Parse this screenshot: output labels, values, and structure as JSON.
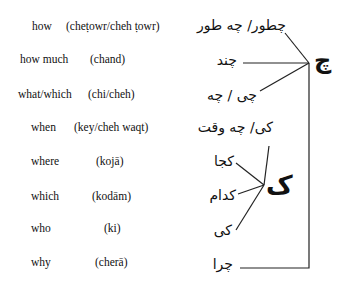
{
  "rows": [
    {
      "english": "how",
      "translit": "(cheṭowr/cheh ṭowr)",
      "persian": "چطور/ چه طور"
    },
    {
      "english": "how much",
      "translit": "(chand)",
      "persian": "چند"
    },
    {
      "english": "what/which",
      "translit": "(chi/cheh)",
      "persian": "چی / چه"
    },
    {
      "english": "when",
      "translit": "(key/cheh waqt)",
      "persian": "کی/ چه وقت"
    },
    {
      "english": "where",
      "translit": "(kojā)",
      "persian": "کجا"
    },
    {
      "english": "which",
      "translit": "(kodām)",
      "persian": "کدام"
    },
    {
      "english": "who",
      "translit": "(ki)",
      "persian": "کی"
    },
    {
      "english": "why",
      "translit": "(cherā)",
      "persian": "چرا"
    }
  ],
  "hubs": {
    "che": "چ",
    "ke": "ک"
  }
}
